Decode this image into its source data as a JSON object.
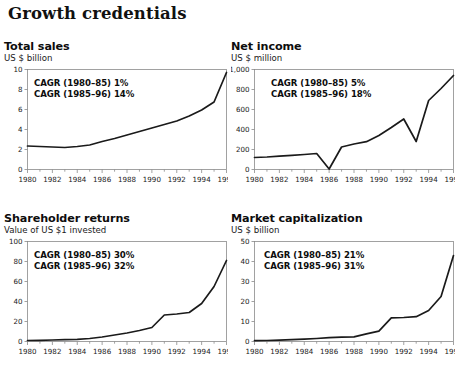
{
  "page": {
    "title": "Growth credentials"
  },
  "charts": [
    {
      "title": "Total sales",
      "subtitle": "US $ billion",
      "cagr_early": "CAGR (1980–85) 1%",
      "cagr_late": "CAGR (1985–96) 14%",
      "chart_data": {
        "type": "line",
        "title": "Total sales",
        "ylabel": "US $ billion",
        "xlabel": "",
        "ylim": [
          0,
          10
        ],
        "xlim": [
          1980,
          1996
        ],
        "yticks": [
          0,
          2,
          4,
          6,
          8,
          10
        ],
        "ytick_labels": [
          "0",
          "2",
          "4",
          "6",
          "8",
          "10"
        ],
        "xticks": [
          1980,
          1982,
          1984,
          1986,
          1988,
          1990,
          1992,
          1994,
          1996
        ],
        "xtick_labels": [
          "1980",
          "1982",
          "1984",
          "1986",
          "1988",
          "1990",
          "1992",
          "1994",
          "1996"
        ],
        "grid": false,
        "legend": "none",
        "x": [
          1980,
          1981,
          1982,
          1983,
          1984,
          1985,
          1986,
          1987,
          1988,
          1989,
          1990,
          1991,
          1992,
          1993,
          1994,
          1995,
          1996
        ],
        "values": [
          2.35,
          2.3,
          2.25,
          2.2,
          2.3,
          2.45,
          2.8,
          3.1,
          3.45,
          3.8,
          4.15,
          4.5,
          4.85,
          5.35,
          5.95,
          6.75,
          9.7
        ]
      }
    },
    {
      "title": "Net income",
      "subtitle": "US $ million",
      "cagr_early": "CAGR (1980–85) 5%",
      "cagr_late": "CAGR (1985–96) 18%",
      "chart_data": {
        "type": "line",
        "title": "Net income",
        "ylabel": "US $ million",
        "xlabel": "",
        "ylim": [
          0,
          1000
        ],
        "xlim": [
          1980,
          1996
        ],
        "yticks": [
          0,
          200,
          400,
          600,
          800,
          1000
        ],
        "ytick_labels": [
          "0",
          "200",
          "400",
          "600",
          "800",
          "1,000"
        ],
        "xticks": [
          1980,
          1982,
          1984,
          1986,
          1988,
          1990,
          1992,
          1994,
          1996
        ],
        "xtick_labels": [
          "1980",
          "1982",
          "1984",
          "1986",
          "1988",
          "1990",
          "1992",
          "1994",
          "1996"
        ],
        "grid": false,
        "legend": "none",
        "x": [
          1980,
          1981,
          1982,
          1983,
          1984,
          1985,
          1986,
          1987,
          1988,
          1989,
          1990,
          1991,
          1992,
          1993,
          1994,
          1995,
          1996
        ],
        "values": [
          120,
          125,
          133,
          142,
          150,
          160,
          5,
          225,
          255,
          278,
          340,
          420,
          505,
          280,
          690,
          810,
          940
        ]
      }
    },
    {
      "title": "Shareholder returns",
      "subtitle": "Value of US $1 invested",
      "cagr_early": "CAGR (1980–85) 30%",
      "cagr_late": "CAGR (1985–96) 32%",
      "chart_data": {
        "type": "line",
        "title": "Shareholder returns",
        "ylabel": "Value of US $1 invested",
        "xlabel": "",
        "ylim": [
          0,
          100
        ],
        "xlim": [
          1980,
          1996
        ],
        "yticks": [
          0,
          20,
          40,
          60,
          80,
          100
        ],
        "ytick_labels": [
          "0",
          "20",
          "40",
          "60",
          "80",
          "100"
        ],
        "xticks": [
          1980,
          1982,
          1984,
          1986,
          1988,
          1990,
          1992,
          1994,
          1996
        ],
        "xtick_labels": [
          "1980",
          "1982",
          "1984",
          "1986",
          "1988",
          "1990",
          "1992",
          "1994",
          "1996"
        ],
        "grid": false,
        "legend": "none",
        "x": [
          1980,
          1981,
          1982,
          1983,
          1984,
          1985,
          1986,
          1987,
          1988,
          1989,
          1990,
          1991,
          1992,
          1993,
          1994,
          1995,
          1996
        ],
        "values": [
          1,
          1.2,
          1.5,
          1.8,
          2.2,
          3,
          4.5,
          6.5,
          8.5,
          11,
          14,
          26.5,
          27.5,
          29,
          38,
          55,
          81
        ]
      }
    },
    {
      "title": "Market capitalization",
      "subtitle": "US $ billion",
      "cagr_early": "CAGR (1980–85) 21%",
      "cagr_late": "CAGR (1985–96) 31%",
      "chart_data": {
        "type": "line",
        "title": "Market capitalization",
        "ylabel": "US $ billion",
        "xlabel": "",
        "ylim": [
          0,
          50
        ],
        "xlim": [
          1980,
          1996
        ],
        "yticks": [
          0,
          10,
          20,
          30,
          40,
          50
        ],
        "ytick_labels": [
          "0",
          "10",
          "20",
          "30",
          "40",
          "50"
        ],
        "xticks": [
          1980,
          1982,
          1984,
          1986,
          1988,
          1990,
          1992,
          1994,
          1996
        ],
        "xtick_labels": [
          "1980",
          "1982",
          "1984",
          "1986",
          "1988",
          "1990",
          "1992",
          "1994",
          "1996"
        ],
        "grid": false,
        "legend": "none",
        "x": [
          1980,
          1981,
          1982,
          1983,
          1984,
          1985,
          1986,
          1987,
          1988,
          1989,
          1990,
          1991,
          1992,
          1993,
          1994,
          1995,
          1996
        ],
        "values": [
          0.4,
          0.5,
          0.7,
          0.9,
          1.2,
          1.5,
          1.9,
          2.2,
          2.3,
          3.8,
          5.2,
          11.8,
          12.0,
          12.4,
          15.5,
          22.5,
          43
        ]
      }
    }
  ],
  "style": {
    "line_color": "#1a1a1a",
    "axis_color": "#8a8a8a",
    "text_color": "#111111"
  }
}
